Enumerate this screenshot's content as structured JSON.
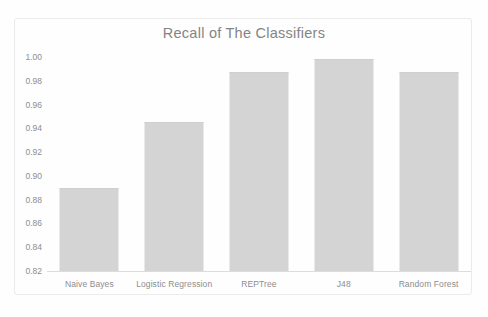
{
  "chart_data": {
    "type": "bar",
    "title": "Recall of The Classifiers",
    "xlabel": "",
    "ylabel": "",
    "categories": [
      "Naive Bayes",
      "Logistic Regression",
      "REPTree",
      "J48",
      "Random Forest"
    ],
    "values": [
      0.89,
      0.945,
      0.987,
      0.998,
      0.987
    ],
    "ylim": [
      0.82,
      1.0
    ],
    "ytick_step": 0.02,
    "yticks": [
      "1.00",
      "0.98",
      "0.96",
      "0.94",
      "0.92",
      "0.90",
      "0.88",
      "0.86",
      "0.84",
      "0.82"
    ],
    "ytick_values": [
      1.0,
      0.98,
      0.96,
      0.94,
      0.92,
      0.9,
      0.88,
      0.86,
      0.84,
      0.82
    ],
    "grid": false,
    "legend": null,
    "legend_position": "none",
    "series": [
      {
        "name": "Recall",
        "values": [
          0.89,
          0.945,
          0.987,
          0.998,
          0.987
        ]
      }
    ],
    "colors": {
      "bar_fill": "#d4d4d4",
      "title_text": "#848484",
      "tick_text": "#8d8d8d",
      "axis_line": "#dcdcdc",
      "frame_border": "#ebebeb",
      "background": "#fefefe"
    }
  }
}
